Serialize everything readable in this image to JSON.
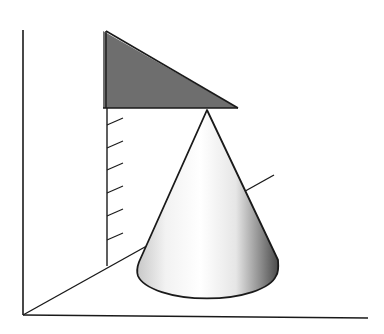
{
  "diagram": {
    "colors": {
      "line": "#1a1a1a",
      "projection_fill": "#6e6e6e",
      "cone_light": "#ffffff",
      "cone_shadow": "#4a4a4a",
      "background": "#ffffff"
    },
    "scale_ticks": 6
  }
}
